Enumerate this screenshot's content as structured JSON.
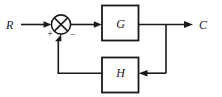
{
  "diagram": {
    "type": "control-system-block-diagram",
    "background_color": "#ffffff",
    "line_color": "#1a1a1a",
    "signals": {
      "input_label": "R",
      "output_label": "C"
    },
    "summing_junction": {
      "name": "summing-junction",
      "glyph": "circle-with-cross",
      "input_sign": "+",
      "feedback_sign": "−"
    },
    "blocks": [
      {
        "id": "forward",
        "label": "G"
      },
      {
        "id": "feedback",
        "label": "H"
      }
    ],
    "paths": [
      {
        "id": "input-wire",
        "from": "R",
        "to": "summing-junction"
      },
      {
        "id": "error-wire",
        "from": "summing-junction",
        "to": "G"
      },
      {
        "id": "output-wire",
        "from": "G",
        "to": "C"
      },
      {
        "id": "takeoff-wire",
        "from": "output-node",
        "to": "H"
      },
      {
        "id": "feedback-wire",
        "from": "H",
        "to": "summing-junction"
      }
    ]
  }
}
